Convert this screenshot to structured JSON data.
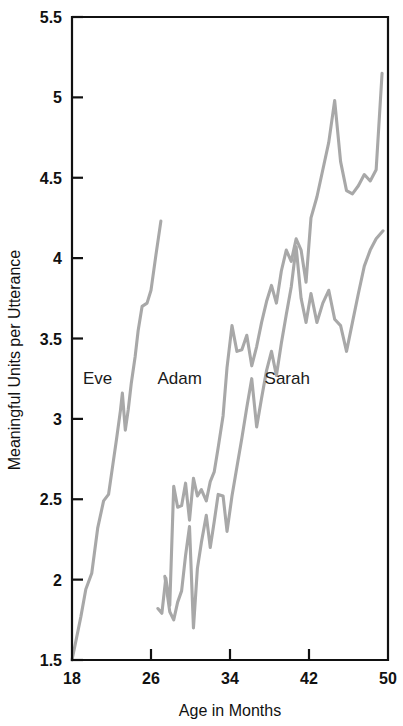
{
  "chart_data": {
    "type": "line",
    "title": "",
    "subtitle": "",
    "xlabel": "Age in Months",
    "ylabel": "Meaningful Units per Utterance",
    "xlim": [
      18,
      50
    ],
    "ylim": [
      1.5,
      5.5
    ],
    "xticks": [
      18,
      26,
      34,
      42,
      50
    ],
    "xtick_labels": [
      "18",
      "26",
      "34",
      "42",
      "50"
    ],
    "yticks": [
      1.5,
      2,
      2.5,
      3,
      3.5,
      4,
      4.5,
      5,
      5.5
    ],
    "ytick_labels": [
      "1.5",
      "2",
      "2.5",
      "3",
      "3.5",
      "4",
      "4.5",
      "5",
      "5.5"
    ],
    "grid": false,
    "legend_position": "inline-annotations",
    "line_color": "#a8a8a8",
    "frame_color": "#111111",
    "background": "#ffffff",
    "annotations": [
      {
        "text": "Eve",
        "x": 20.6,
        "y": 3.22
      },
      {
        "text": "Adam",
        "x": 28.9,
        "y": 3.22
      },
      {
        "text": "Sarah",
        "x": 39.8,
        "y": 3.22
      }
    ],
    "series": [
      {
        "name": "Eve",
        "color": "#a8a8a8",
        "x": [
          18.0,
          18.9,
          19.4,
          20.0,
          20.6,
          21.2,
          21.7,
          22.1,
          22.5,
          22.9,
          23.1,
          23.4,
          23.7,
          24.0,
          24.4,
          24.7,
          25.1,
          25.6,
          26.0,
          26.5,
          27.0
        ],
        "y": [
          1.5,
          1.77,
          1.94,
          2.04,
          2.32,
          2.49,
          2.53,
          2.7,
          2.87,
          3.05,
          3.16,
          2.93,
          3.06,
          3.22,
          3.39,
          3.55,
          3.7,
          3.72,
          3.8,
          4.02,
          4.23
        ]
      },
      {
        "name": "Adam",
        "color": "#a8a8a8",
        "x": [
          26.7,
          27.1,
          27.5,
          27.9,
          28.3,
          28.7,
          29.1,
          29.5,
          29.9,
          30.3,
          30.7,
          31.1,
          31.6,
          32.0,
          32.4,
          32.8,
          33.3,
          33.7,
          34.2,
          34.7,
          35.2,
          35.7,
          36.2,
          36.7,
          37.2,
          37.7,
          38.2,
          38.7,
          39.2,
          39.7,
          40.2,
          40.7,
          41.2,
          41.7,
          42.2,
          42.8,
          43.4,
          44.0,
          44.6,
          45.2,
          45.8,
          46.4,
          47.0,
          47.6,
          48.2,
          48.8,
          49.4
        ],
        "y": [
          1.82,
          1.79,
          2.01,
          1.84,
          2.58,
          2.45,
          2.46,
          2.6,
          2.37,
          2.63,
          2.52,
          2.56,
          2.49,
          2.61,
          2.67,
          2.82,
          3.02,
          3.32,
          3.58,
          3.42,
          3.43,
          3.52,
          3.33,
          3.45,
          3.6,
          3.73,
          3.83,
          3.72,
          3.92,
          4.05,
          3.98,
          4.12,
          4.05,
          3.85,
          4.25,
          4.38,
          4.55,
          4.72,
          4.98,
          4.6,
          4.42,
          4.4,
          4.45,
          4.52,
          4.48,
          4.55,
          5.15
        ]
      },
      {
        "name": "Sarah",
        "color": "#a8a8a8",
        "x": [
          27.4,
          27.9,
          28.3,
          28.7,
          29.1,
          29.5,
          29.9,
          30.3,
          30.7,
          31.1,
          31.6,
          32.0,
          32.4,
          32.8,
          33.3,
          33.7,
          34.2,
          34.7,
          35.2,
          35.7,
          36.2,
          36.7,
          37.2,
          37.7,
          38.2,
          38.7,
          39.2,
          39.7,
          40.2,
          40.7,
          41.2,
          41.7,
          42.2,
          42.8,
          43.4,
          44.0,
          44.6,
          45.2,
          45.8,
          46.4,
          47.0,
          47.6,
          48.2,
          48.8,
          49.5
        ],
        "y": [
          2.02,
          1.8,
          1.75,
          1.86,
          1.93,
          2.15,
          2.33,
          1.7,
          2.07,
          2.23,
          2.4,
          2.2,
          2.36,
          2.53,
          2.52,
          2.3,
          2.52,
          2.7,
          2.88,
          3.07,
          3.25,
          2.95,
          3.13,
          3.3,
          3.42,
          3.27,
          3.47,
          3.65,
          3.82,
          4.07,
          3.75,
          3.6,
          3.78,
          3.6,
          3.72,
          3.8,
          3.62,
          3.58,
          3.42,
          3.6,
          3.78,
          3.95,
          4.05,
          4.12,
          4.17
        ]
      }
    ]
  },
  "figure": {
    "xlabel_text": "Age in Months",
    "ylabel_text": "Meaningful Units per Utterance"
  }
}
